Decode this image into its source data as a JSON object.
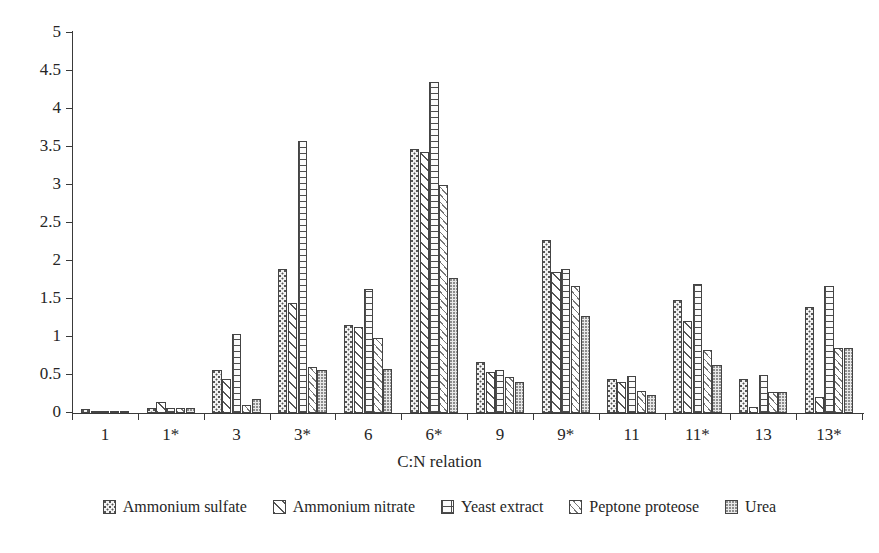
{
  "chart_data": {
    "type": "bar",
    "title": "",
    "xlabel": "C:N relation",
    "ylabel": "",
    "ylim": [
      0,
      5
    ],
    "ytick_labels": [
      "0",
      "0.5",
      "1",
      "1.5",
      "2",
      "2.5",
      "3",
      "3.5",
      "4",
      "4.5",
      "5"
    ],
    "ytick_values": [
      0,
      0.5,
      1,
      1.5,
      2,
      2.5,
      3,
      3.5,
      4,
      4.5,
      5
    ],
    "grid": false,
    "legend_position": "bottom",
    "categories": [
      "1",
      "1*",
      "3",
      "3*",
      "6",
      "6*",
      "9",
      "9*",
      "11",
      "11*",
      "13",
      "13*"
    ],
    "series": [
      {
        "name": "Ammonium sulfate",
        "pattern": "dense-stipple",
        "values": [
          0.05,
          0.06,
          0.57,
          1.89,
          1.16,
          3.47,
          0.67,
          2.27,
          0.45,
          1.49,
          0.45,
          1.4
        ]
      },
      {
        "name": "Ammonium nitrate",
        "pattern": "wide-diagonal-hatch",
        "values": [
          0.02,
          0.15,
          0.45,
          1.45,
          1.13,
          3.44,
          0.54,
          1.85,
          0.41,
          1.21,
          0.08,
          0.21
        ]
      },
      {
        "name": "Yeast extract",
        "pattern": "grid-ladder",
        "values": [
          0.03,
          0.07,
          1.04,
          3.58,
          1.63,
          4.35,
          0.56,
          1.9,
          0.49,
          1.7,
          0.5,
          1.67
        ]
      },
      {
        "name": "Peptone proteose",
        "pattern": "narrow-diagonal-hatch",
        "values": [
          0.02,
          0.06,
          0.1,
          0.6,
          0.99,
          3.0,
          0.47,
          1.67,
          0.29,
          0.83,
          0.27,
          0.86
        ]
      },
      {
        "name": "Urea",
        "pattern": "fine-stipple",
        "values": [
          0.02,
          0.07,
          0.18,
          0.57,
          0.58,
          1.77,
          0.41,
          1.27,
          0.24,
          0.63,
          0.27,
          0.85
        ]
      }
    ]
  },
  "axis": {
    "x_title": "C:N relation"
  },
  "colors": {
    "axis": "#3a3a3a",
    "bar_outline": "#444444",
    "text": "#262626",
    "background": "#ffffff"
  }
}
